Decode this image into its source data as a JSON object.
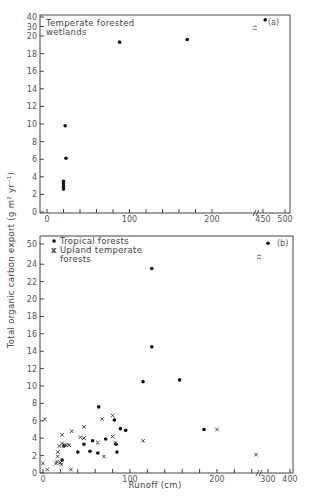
{
  "chart_data": [
    {
      "type": "scatter",
      "panel_label": "(a)",
      "title": "",
      "xlabel": "",
      "ylabel": "Total organic carbon export (g m^2 yr^-1)",
      "x_ticks": [
        "0",
        "100",
        "200",
        "450",
        "500"
      ],
      "y_ticks": [
        "0",
        "2",
        "4",
        "6",
        "8",
        "10",
        "12",
        "14",
        "16",
        "18",
        "20",
        "30",
        "40"
      ],
      "xlim": [
        0,
        500
      ],
      "ylim": [
        0,
        40
      ],
      "x_axis_break": [
        220,
        440
      ],
      "y_axis_break": [
        20,
        30
      ],
      "grid": false,
      "legend_position": "top-left",
      "series": [
        {
          "name": "Temperate forested wetlands",
          "marker": "dot",
          "points": [
            {
              "x": 20,
              "y": 2.6
            },
            {
              "x": 20,
              "y": 2.9
            },
            {
              "x": 20,
              "y": 3.2
            },
            {
              "x": 20,
              "y": 3.5
            },
            {
              "x": 22,
              "y": 9.8
            },
            {
              "x": 23,
              "y": 6.1
            },
            {
              "x": 88,
              "y": 19.3
            },
            {
              "x": 170,
              "y": 19.6
            },
            {
              "x": 455,
              "y": 37
            }
          ]
        }
      ]
    },
    {
      "type": "scatter",
      "panel_label": "(b)",
      "title": "",
      "xlabel": "Runoff (cm)",
      "ylabel": "Total organic carbon export (g m^2 yr^-1)",
      "x_ticks": [
        "0",
        "100",
        "200",
        "300",
        "400"
      ],
      "y_ticks": [
        "0",
        "2",
        "4",
        "6",
        "8",
        "10",
        "12",
        "14",
        "16",
        "18",
        "20",
        "22",
        "24",
        "50"
      ],
      "xlim": [
        0,
        400
      ],
      "ylim": [
        0,
        50
      ],
      "x_axis_break": [
        250,
        290
      ],
      "y_axis_break": [
        24,
        50
      ],
      "grid": false,
      "legend_position": "top-left",
      "series": [
        {
          "name": "Tropical forests",
          "marker": "dot",
          "points": [
            {
              "x": 22,
              "y": 1.5
            },
            {
              "x": 24,
              "y": 3.1
            },
            {
              "x": 40,
              "y": 2.4
            },
            {
              "x": 47,
              "y": 3.3
            },
            {
              "x": 54,
              "y": 2.5
            },
            {
              "x": 57,
              "y": 3.7
            },
            {
              "x": 63,
              "y": 2.3
            },
            {
              "x": 64,
              "y": 7.6
            },
            {
              "x": 72,
              "y": 3.9
            },
            {
              "x": 82,
              "y": 6.1
            },
            {
              "x": 84,
              "y": 3.3
            },
            {
              "x": 85,
              "y": 2.4
            },
            {
              "x": 89,
              "y": 5.1
            },
            {
              "x": 95,
              "y": 4.9
            },
            {
              "x": 115,
              "y": 10.5
            },
            {
              "x": 125,
              "y": 14.5
            },
            {
              "x": 125,
              "y": 23.5
            },
            {
              "x": 157,
              "y": 10.7
            },
            {
              "x": 185,
              "y": 5.0
            },
            {
              "x": 300,
              "y": 51
            }
          ]
        },
        {
          "name": "Upland temperate forests",
          "marker": "x",
          "points": [
            {
              "x": 0,
              "y": 1.1
            },
            {
              "x": 2,
              "y": 6.2
            },
            {
              "x": 5,
              "y": 0.4
            },
            {
              "x": 15,
              "y": 1.1
            },
            {
              "x": 16,
              "y": 1.3
            },
            {
              "x": 17,
              "y": 1.9
            },
            {
              "x": 17,
              "y": 2.4
            },
            {
              "x": 19,
              "y": 3.1
            },
            {
              "x": 20,
              "y": 1.2
            },
            {
              "x": 21,
              "y": 1.0
            },
            {
              "x": 22,
              "y": 3.4
            },
            {
              "x": 22,
              "y": 4.4
            },
            {
              "x": 25,
              "y": 3.2
            },
            {
              "x": 27,
              "y": 3.2
            },
            {
              "x": 30,
              "y": 3.2
            },
            {
              "x": 32,
              "y": 0.4
            },
            {
              "x": 33,
              "y": 4.8
            },
            {
              "x": 43,
              "y": 4.1
            },
            {
              "x": 47,
              "y": 5.3
            },
            {
              "x": 47,
              "y": 4.0
            },
            {
              "x": 63,
              "y": 3.5
            },
            {
              "x": 68,
              "y": 6.2
            },
            {
              "x": 70,
              "y": 1.9
            },
            {
              "x": 80,
              "y": 6.6
            },
            {
              "x": 80,
              "y": 4.2
            },
            {
              "x": 83,
              "y": 3.5
            },
            {
              "x": 115,
              "y": 3.7
            },
            {
              "x": 200,
              "y": 5.0
            },
            {
              "x": 245,
              "y": 2.1
            }
          ]
        }
      ]
    }
  ],
  "panels": {
    "a": {
      "label": "(a)",
      "legend": [
        "Temperate forested",
        "wetlands"
      ],
      "y_tick_labels": [
        "0",
        "2",
        "4",
        "6",
        "8",
        "10",
        "12",
        "14",
        "16",
        "18",
        "20",
        "30",
        "40"
      ],
      "x_tick_labels": [
        "0",
        "100",
        "200",
        "450",
        "500"
      ]
    },
    "b": {
      "label": "(b)",
      "legend_dot": "Tropical forests",
      "legend_x": [
        "Upland temperate",
        "forests"
      ],
      "y_tick_labels": [
        "0",
        "2",
        "4",
        "6",
        "8",
        "10",
        "12",
        "14",
        "16",
        "18",
        "20",
        "22",
        "24",
        "50"
      ],
      "x_tick_labels": [
        "0",
        "100",
        "200",
        "300",
        "400"
      ],
      "xlabel": "Runoff (cm)"
    },
    "shared_ylabel": "Total organic carbon export (g m² yr⁻¹)"
  }
}
